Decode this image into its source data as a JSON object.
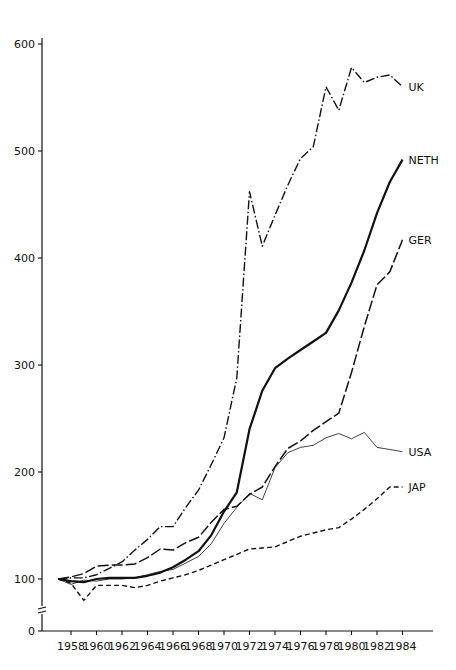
{
  "chart_data": {
    "type": "line",
    "title": "",
    "xlabel": "",
    "ylabel": "",
    "x": [
      1957,
      1958,
      1959,
      1960,
      1961,
      1962,
      1963,
      1964,
      1965,
      1966,
      1967,
      1968,
      1969,
      1970,
      1971,
      1972,
      1973,
      1974,
      1975,
      1976,
      1977,
      1978,
      1979,
      1980,
      1981,
      1982,
      1983,
      1984
    ],
    "x_ticks": [
      "1958",
      "1960",
      "1962",
      "1964",
      "1966",
      "1968",
      "1970",
      "1972",
      "1974",
      "1976",
      "1978",
      "1980",
      "1982",
      "1984"
    ],
    "y_ticks": [
      "0",
      "100",
      "200",
      "300",
      "400",
      "500",
      "600"
    ],
    "ylim": [
      0,
      610
    ],
    "y_axis_break": "between 0 and 100",
    "grid": false,
    "legend": "inline labels at line ends (right)",
    "series": [
      {
        "name": "UK",
        "style": "dash-dot",
        "values": [
          100,
          101,
          101,
          104,
          110,
          116,
          127,
          137,
          149,
          149,
          167,
          183,
          207,
          232,
          288,
          462,
          411,
          440,
          468,
          493,
          504,
          560,
          538,
          578,
          564,
          569,
          571,
          560
        ]
      },
      {
        "name": "NETH",
        "style": "solid-thick",
        "values": [
          100,
          98,
          97,
          100,
          101,
          101,
          101,
          103,
          106,
          111,
          118,
          126,
          141,
          163,
          181,
          240,
          276,
          297,
          306,
          314,
          322,
          330,
          351,
          377,
          407,
          442,
          471,
          492
        ]
      },
      {
        "name": "GER",
        "style": "long-dash",
        "values": [
          100,
          102,
          105,
          112,
          113,
          113,
          114,
          120,
          128,
          127,
          134,
          139,
          153,
          165,
          168,
          179,
          186,
          205,
          222,
          229,
          239,
          247,
          255,
          293,
          336,
          375,
          387,
          417
        ]
      },
      {
        "name": "USA",
        "style": "thin-solid",
        "values": [
          100,
          95,
          99,
          98,
          100,
          100,
          101,
          104,
          107,
          109,
          115,
          121,
          133,
          152,
          167,
          180,
          174,
          204,
          218,
          223,
          225,
          232,
          236,
          231,
          237,
          223,
          221,
          219
        ]
      },
      {
        "name": "JAP",
        "style": "short-dash",
        "values": [
          100,
          96,
          80,
          94,
          94,
          94,
          92,
          94,
          98,
          101,
          104,
          108,
          113,
          118,
          123,
          128,
          129,
          130,
          135,
          140,
          143,
          146,
          148,
          156,
          165,
          175,
          186,
          186
        ]
      }
    ]
  }
}
